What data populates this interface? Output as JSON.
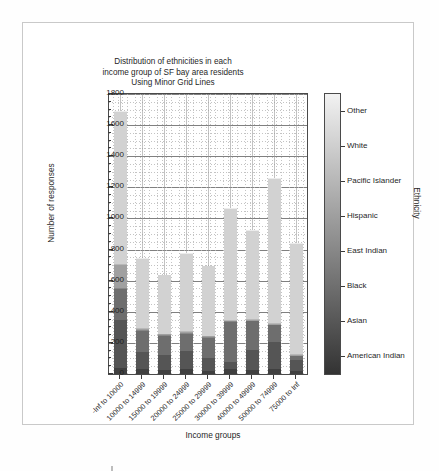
{
  "chart_data": {
    "type": "bar",
    "variant": "stacked-bar",
    "title": "Distribution of ethnicities in each income group of SF bay area residents Using Minor Grid Lines",
    "title_lines": [
      "Distribution of ethnicities in each",
      "income group of SF bay area residents",
      "Using Minor Grid Lines"
    ],
    "xlabel": "Income groups",
    "ylabel": "Number of responses",
    "legend_title": "Ethnicity",
    "legend_position": "right-colorbar",
    "grid": "major and minor grid lines",
    "ylim": [
      0,
      1800
    ],
    "yticks": [
      0,
      200,
      400,
      600,
      800,
      1000,
      1200,
      1400,
      1600,
      1800
    ],
    "ytick_labels": [
      "0",
      "200",
      "400",
      "600",
      "800",
      "1000",
      "1200",
      "1400",
      "1600",
      "1800"
    ],
    "y_minor_step": 50,
    "categories": [
      "-Inf to 10000",
      "10000 to 14999",
      "15000 to 19999",
      "20000 to 24999",
      "25000 to 29999",
      "30000 to 39999",
      "40000 to 49999",
      "50000 to 74999",
      "75000 to  Inf"
    ],
    "series": [
      {
        "name": "American Indian",
        "color": "#404040",
        "values": [
          40,
          30,
          25,
          30,
          22,
          30,
          28,
          35,
          18
        ]
      },
      {
        "name": "Asian",
        "color": "#555555",
        "values": [
          310,
          110,
          95,
          120,
          78,
          50,
          125,
          172,
          75
        ]
      },
      {
        "name": "Black",
        "color": "#6e6e6e",
        "values": [
          195,
          135,
          125,
          110,
          132,
          255,
          185,
          105,
          20
        ]
      },
      {
        "name": "East Indian",
        "color": "#888888",
        "values": [
          8,
          5,
          5,
          5,
          5,
          4,
          4,
          5,
          5
        ]
      },
      {
        "name": "Hispanic",
        "color": "#a0a0a0",
        "values": [
          145,
          10,
          5,
          5,
          5,
          5,
          4,
          5,
          5
        ]
      },
      {
        "name": "Pacific Islander",
        "color": "#b8b8b8",
        "values": [
          10,
          5,
          5,
          5,
          5,
          5,
          5,
          5,
          5
        ]
      },
      {
        "name": "White",
        "color": "#d2d2d2",
        "values": [
          975,
          445,
          375,
          500,
          445,
          715,
          570,
          925,
          705
        ]
      },
      {
        "name": "Other",
        "color": "#ececec",
        "values": [
          7,
          5,
          5,
          5,
          3,
          6,
          4,
          8,
          7
        ]
      }
    ],
    "totals": [
      1690,
      745,
      640,
      780,
      695,
      1070,
      925,
      1260,
      840
    ],
    "legend_entries": [
      "American Indian",
      "Asian",
      "Black",
      "East Indian",
      "Hispanic",
      "Pacific Islander",
      "White",
      "Other"
    ],
    "colorbar_gradient_low": "#333333",
    "colorbar_gradient_high": "#f2f2f2"
  }
}
